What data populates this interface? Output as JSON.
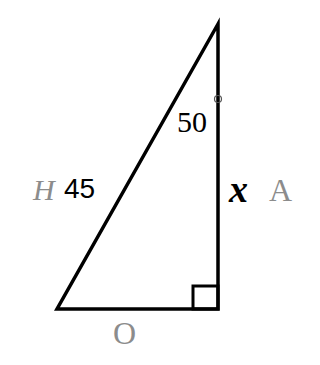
{
  "diagram": {
    "type": "right-triangle",
    "vertices": {
      "top": [
        218,
        24
      ],
      "bottom_left": [
        57,
        309
      ],
      "bottom_right": [
        218,
        309
      ]
    },
    "angle_label": {
      "value": "50",
      "degree_symbol": "°"
    },
    "hypotenuse": {
      "value": "45",
      "side_label": "H"
    },
    "adjacent": {
      "variable": "x",
      "side_label": "A"
    },
    "opposite": {
      "side_label": "O"
    },
    "right_angle_marker": true,
    "colors": {
      "stroke": "#000000",
      "side_label": "#8c8c8c",
      "text": "#000000"
    }
  }
}
